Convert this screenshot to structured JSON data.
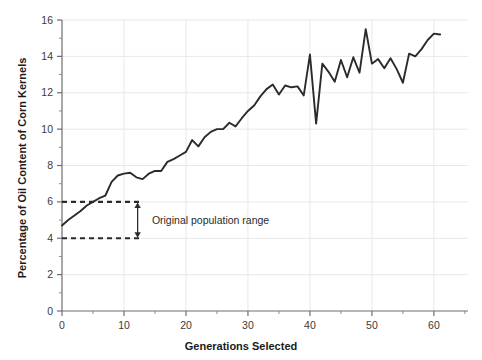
{
  "chart_data": {
    "type": "line",
    "title": "",
    "xlabel": "Generations Selected",
    "ylabel": "Percentage of Oil Content of Corn Kernels",
    "xlim": [
      0,
      65.5
    ],
    "ylim": [
      0,
      16
    ],
    "x_major_ticks": [
      0,
      10,
      20,
      30,
      40,
      50,
      60
    ],
    "x_minor_ticks": [
      5,
      15,
      25,
      35,
      45,
      55,
      65
    ],
    "y_major_ticks": [
      0,
      2,
      4,
      6,
      8,
      10,
      12,
      14,
      16
    ],
    "y_minor_ticks": [
      1,
      3,
      5,
      7,
      9,
      11,
      13,
      15
    ],
    "x_tick_labels": [
      "0",
      "10",
      "20",
      "30",
      "40",
      "50",
      "60"
    ],
    "y_tick_labels": [
      "0",
      "2",
      "4",
      "6",
      "8",
      "10",
      "12",
      "14",
      "16"
    ],
    "grid": true,
    "grid_color": "#e8e8e8",
    "legend": false,
    "line_color": "#2b2b2b",
    "line_width": 1.9,
    "series": [
      {
        "name": "Oil content",
        "x": [
          0,
          1,
          2,
          3,
          4,
          5,
          6,
          7,
          8,
          9,
          10,
          11,
          12,
          13,
          14,
          15,
          16,
          17,
          18,
          19,
          20,
          21,
          22,
          23,
          24,
          25,
          26,
          27,
          28,
          29,
          30,
          31,
          32,
          33,
          34,
          35,
          36,
          37,
          38,
          39,
          40,
          41,
          42,
          43,
          44,
          45,
          46,
          47,
          48,
          49,
          50,
          51,
          52,
          53,
          54,
          55,
          56,
          57,
          58,
          59,
          60,
          61
        ],
        "values": [
          4.7,
          5.0,
          5.25,
          5.5,
          5.8,
          6.0,
          6.2,
          6.35,
          7.1,
          7.45,
          7.55,
          7.6,
          7.35,
          7.25,
          7.55,
          7.7,
          7.7,
          8.2,
          8.35,
          8.55,
          8.75,
          9.4,
          9.05,
          9.55,
          9.85,
          10.0,
          10.0,
          10.35,
          10.15,
          10.6,
          11.0,
          11.3,
          11.8,
          12.2,
          12.45,
          11.9,
          12.4,
          12.3,
          12.35,
          11.85,
          14.1,
          10.3,
          13.6,
          13.15,
          12.6,
          13.8,
          12.85,
          13.95,
          13.1,
          15.5,
          13.6,
          13.85,
          13.35,
          13.9,
          13.3,
          12.55,
          14.15,
          14.0,
          14.4,
          14.9,
          15.25,
          15.2
        ]
      }
    ],
    "annotations": {
      "range_label": "Original population range",
      "upper_dashed_y": 6,
      "lower_dashed_y": 4,
      "dashed_x_start": 0,
      "dashed_x_end": 12.5,
      "arrow_x": 12.2,
      "label_x": 14.5,
      "label_y": 5.0,
      "dash_color": "#2b2b2b",
      "arrow_color": "#2b2b2b"
    }
  },
  "axis": {
    "x_title": "Generations Selected",
    "y_title": "Percentage of Oil Content of Corn Kernels"
  }
}
